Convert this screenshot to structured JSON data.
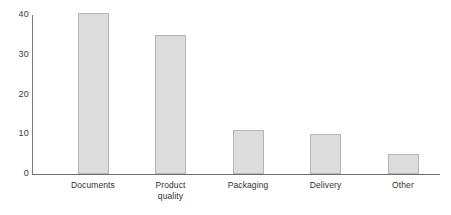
{
  "chart_data": {
    "type": "bar",
    "title": "",
    "subtitle": "",
    "xlabel": "",
    "ylabel": "",
    "categories": [
      "Documents",
      "Product quality",
      "Packaging",
      "Delivery",
      "Other"
    ],
    "category_lines": [
      [
        "Documents"
      ],
      [
        "Product",
        "quality"
      ],
      [
        "Packaging"
      ],
      [
        "Delivery"
      ],
      [
        "Other"
      ]
    ],
    "values": [
      40.5,
      35,
      11,
      10,
      5
    ],
    "ylim": [
      0,
      40
    ],
    "yticks": [
      0,
      10,
      20,
      30,
      40
    ],
    "ytick_labels": [
      "0",
      "10",
      "20",
      "30",
      "40"
    ],
    "grid": false,
    "legend": false,
    "legend_position": "none",
    "bar_fill_color": "#dcdcdc",
    "bar_border_color": "#b6b6b6",
    "axis_color": "#6f6f6f",
    "background_color": "#ffffff"
  }
}
